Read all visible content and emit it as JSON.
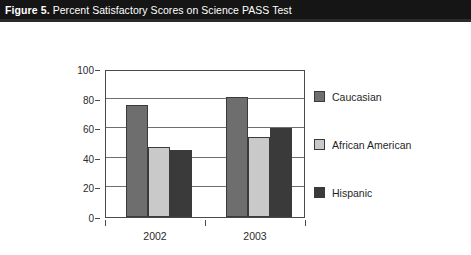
{
  "caption": {
    "figure_number": "Figure 5.",
    "title": "Percent Satisfactory Scores on Science PASS Test"
  },
  "chart_data": {
    "type": "bar",
    "title": "Percent Satisfactory Scores on Science PASS Test",
    "xlabel": "",
    "ylabel": "",
    "ylim": [
      0,
      100
    ],
    "yticks": [
      0,
      20,
      40,
      60,
      80,
      100
    ],
    "ytick_labels": [
      "0",
      "20",
      "40",
      "60",
      "80",
      "100"
    ],
    "categories": [
      "2002",
      "2003"
    ],
    "grid": true,
    "legend_position": "right",
    "series": [
      {
        "name": "Caucasian",
        "values": [
          76,
          81
        ],
        "color": "#6e6e6e"
      },
      {
        "name": "African American",
        "values": [
          47,
          54
        ],
        "color": "#c9c9c9"
      },
      {
        "name": "Hispanic",
        "values": [
          45,
          60
        ],
        "color": "#3a3a3a"
      }
    ]
  },
  "legend": {
    "items": [
      {
        "label": "Caucasian",
        "color": "#6e6e6e"
      },
      {
        "label": "African American",
        "color": "#c9c9c9"
      },
      {
        "label": "Hispanic",
        "color": "#3a3a3a"
      }
    ]
  }
}
